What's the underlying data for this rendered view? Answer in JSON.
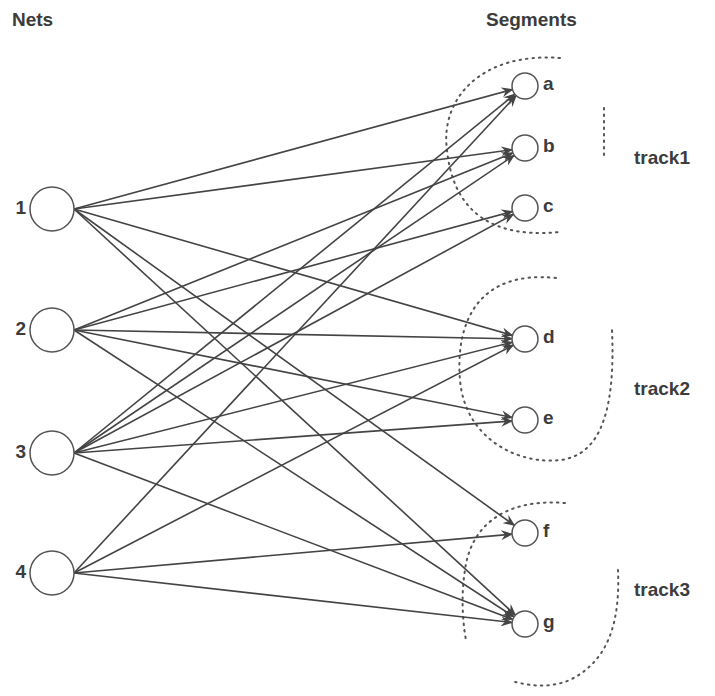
{
  "headers": {
    "nets": "Nets",
    "segments": "Segments"
  },
  "nets": [
    {
      "id": "1",
      "label": "1",
      "cx": 52,
      "cy": 209
    },
    {
      "id": "2",
      "label": "2",
      "cx": 52,
      "cy": 330
    },
    {
      "id": "3",
      "label": "3",
      "cx": 52,
      "cy": 453
    },
    {
      "id": "4",
      "label": "4",
      "cx": 52,
      "cy": 573
    }
  ],
  "segments": [
    {
      "id": "a",
      "label": "a",
      "cx": 525,
      "cy": 86,
      "track": "track1"
    },
    {
      "id": "b",
      "label": "b",
      "cx": 525,
      "cy": 148,
      "track": "track1"
    },
    {
      "id": "c",
      "label": "c",
      "cx": 525,
      "cy": 208,
      "track": "track1"
    },
    {
      "id": "d",
      "label": "d",
      "cx": 525,
      "cy": 339,
      "track": "track2"
    },
    {
      "id": "e",
      "label": "e",
      "cx": 525,
      "cy": 420,
      "track": "track2"
    },
    {
      "id": "f",
      "label": "f",
      "cx": 525,
      "cy": 533,
      "track": "track3"
    },
    {
      "id": "g",
      "label": "g",
      "cx": 525,
      "cy": 624,
      "track": "track3"
    }
  ],
  "tracks": [
    {
      "id": "track1",
      "label": "track1",
      "label_x": 634,
      "label_y": 160
    },
    {
      "id": "track2",
      "label": "track2",
      "label_x": 634,
      "label_y": 391
    },
    {
      "id": "track3",
      "label": "track3",
      "label_x": 634,
      "label_y": 592
    }
  ],
  "edges": [
    {
      "from": "1",
      "to": "a"
    },
    {
      "from": "1",
      "to": "b"
    },
    {
      "from": "1",
      "to": "d"
    },
    {
      "from": "1",
      "to": "f"
    },
    {
      "from": "1",
      "to": "g"
    },
    {
      "from": "2",
      "to": "b"
    },
    {
      "from": "2",
      "to": "c"
    },
    {
      "from": "2",
      "to": "d"
    },
    {
      "from": "2",
      "to": "e"
    },
    {
      "from": "2",
      "to": "g"
    },
    {
      "from": "3",
      "to": "a"
    },
    {
      "from": "3",
      "to": "b"
    },
    {
      "from": "3",
      "to": "c"
    },
    {
      "from": "3",
      "to": "d"
    },
    {
      "from": "3",
      "to": "e"
    },
    {
      "from": "3",
      "to": "g"
    },
    {
      "from": "4",
      "to": "a"
    },
    {
      "from": "4",
      "to": "d"
    },
    {
      "from": "4",
      "to": "f"
    },
    {
      "from": "4",
      "to": "g"
    }
  ],
  "style": {
    "stroke": "#444444",
    "dotted": "#555555"
  }
}
